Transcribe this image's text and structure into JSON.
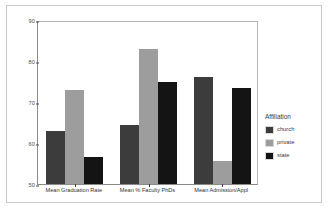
{
  "chart_data": {
    "type": "bar",
    "title": "",
    "xlabel": "",
    "ylabel": "",
    "ylim": [
      50,
      90
    ],
    "yticks": [
      50,
      60,
      70,
      80,
      90
    ],
    "grid": false,
    "legend_position": "right",
    "legend_title": "Affiliation",
    "categories": [
      "Mean Graduation Rate",
      "Mean % Faculty PhDs",
      "Mean Admission/Appl"
    ],
    "series": [
      {
        "name": "church",
        "color": "#3c3c3c",
        "values": [
          63.0,
          64.5,
          76.0
        ]
      },
      {
        "name": "private",
        "color": "#9d9d9d",
        "values": [
          73.0,
          83.0,
          55.5
        ]
      },
      {
        "name": "state",
        "color": "#141414",
        "values": [
          56.5,
          75.0,
          73.5
        ]
      }
    ]
  },
  "legend": {
    "title": "Affiliation",
    "items": [
      {
        "label": "church"
      },
      {
        "label": "private"
      },
      {
        "label": "state"
      }
    ]
  },
  "axis": {
    "y_tick_labels": [
      "90",
      "80",
      "70",
      "60",
      "50"
    ]
  }
}
